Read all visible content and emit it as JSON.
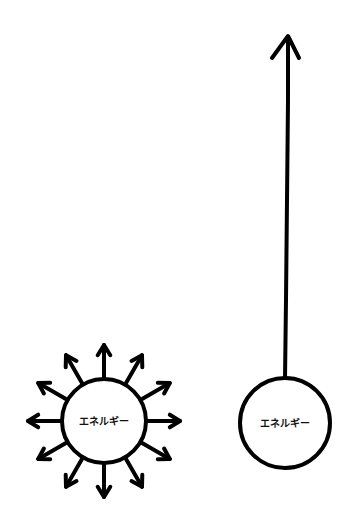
{
  "diagram": {
    "left": {
      "label": "エネルギー",
      "description": "energy radiating outward in all directions",
      "center": [
        104,
        421
      ],
      "radius": 42,
      "arrow_count": 12
    },
    "right": {
      "label": "エネルギー",
      "description": "energy directed in a single upward direction",
      "center": [
        285,
        423
      ],
      "radius": 45,
      "arrow_tip_y": 36
    },
    "colors": {
      "stroke": "#000000",
      "background": "#ffffff",
      "text": "#111111"
    }
  }
}
